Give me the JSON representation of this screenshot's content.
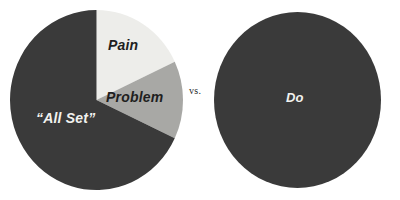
{
  "figure": {
    "background_color": "#ffffff",
    "versus_label": "vs."
  },
  "colors": {
    "dark": "#3a3a3a",
    "medium_gray": "#a8a8a5",
    "light_gray": "#ededea",
    "label_on_light": "#1f1f1f",
    "label_on_dark": "#f2f2ef"
  },
  "charts": {
    "left": {
      "name": "segmented-pie",
      "slices": [
        {
          "label": "Pain",
          "value": 18,
          "color": "#ededea",
          "label_color": "#1f1f1f"
        },
        {
          "label": "Problem",
          "value": 14,
          "color": "#a8a8a5",
          "label_color": "#1f1f1f"
        },
        {
          "label": "“All Set”",
          "value": 68,
          "color": "#3a3a3a",
          "label_color": "#f2f2ef"
        }
      ]
    },
    "right": {
      "name": "solid-pie",
      "slices": [
        {
          "label": "Do",
          "value": 100,
          "color": "#3a3a3a",
          "label_color": "#f2f2ef"
        }
      ]
    }
  },
  "chart_data": [
    {
      "type": "pie",
      "title": "",
      "categories": [
        "Pain",
        "Problem",
        "“All Set”"
      ],
      "values": [
        18,
        14,
        68
      ],
      "colors": [
        "#ededea",
        "#a8a8a5",
        "#3a3a3a"
      ],
      "start_angle_deg": 0,
      "direction": "clockwise",
      "legend": "none",
      "labels_inside": true,
      "annotations": [
        "Pain",
        "Problem",
        "“All Set”"
      ]
    },
    {
      "type": "pie",
      "title": "",
      "categories": [
        "Do"
      ],
      "values": [
        100
      ],
      "colors": [
        "#3a3a3a"
      ],
      "start_angle_deg": 0,
      "direction": "clockwise",
      "legend": "none",
      "labels_inside": true,
      "annotations": [
        "Do"
      ]
    }
  ]
}
